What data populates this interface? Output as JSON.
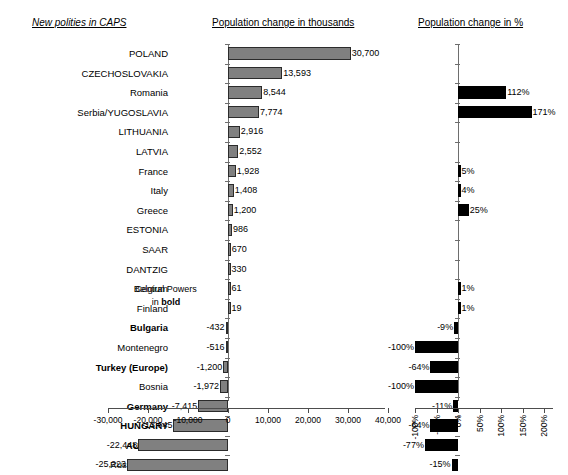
{
  "headers": {
    "legend_note": "New polities in CAPS",
    "left_title": "Population change in thousands",
    "right_title": "Population change in %"
  },
  "annotation": {
    "line1": "Central Powers",
    "line2_prefix": "in ",
    "line2_bold": "bold"
  },
  "chart_data": {
    "type": "bar",
    "orientation": "horizontal",
    "grid": false,
    "legend": false,
    "categories": [
      "POLAND",
      "CZECHOSLOVAKIA",
      "Romania",
      "Serbia/YUGOSLAVIA",
      "LITHUANIA",
      "LATVIA",
      "France",
      "Italy",
      "Greece",
      "ESTONIA",
      "SAAR",
      "DANTZIG",
      "Belgium",
      "Finland",
      "Bulgaria",
      "Montenegro",
      "Turkey (Europe)",
      "Bosnia",
      "Germany",
      "HUNGARY",
      "AUSTRIA",
      "Russia/USSR"
    ],
    "category_styles": [
      "normal",
      "normal",
      "normal",
      "normal",
      "normal",
      "normal",
      "normal",
      "normal",
      "normal",
      "normal",
      "normal",
      "normal",
      "normal",
      "normal",
      "bold",
      "normal",
      "bold",
      "normal",
      "bold",
      "bold",
      "bold",
      "normal"
    ],
    "panels": [
      {
        "name": "thousands",
        "xlabel": "Population change in thousands",
        "xlim": [
          -30000,
          40000
        ],
        "xticks": [
          -30000,
          -20000,
          -10000,
          0,
          10000,
          20000,
          30000,
          40000
        ],
        "xticklabels": [
          "-30,000",
          "-20,000",
          "-10,000",
          "0",
          "10,000",
          "20,000",
          "30,000",
          "40,000"
        ],
        "values": [
          30700,
          13593,
          8544,
          7774,
          2916,
          2552,
          1928,
          1408,
          1200,
          986,
          670,
          330,
          61,
          19,
          -432,
          -516,
          -1200,
          -1972,
          -7415,
          -13645,
          -22448,
          -25223
        ],
        "datalabels": [
          "30,700",
          "13,593",
          "8,544",
          "7,774",
          "2,916",
          "2,552",
          "1,928",
          "1,408",
          "1,200",
          "986",
          "670",
          "330",
          "61",
          "19",
          "-432",
          "-516",
          "-1,200",
          "-1,972",
          "-7,415",
          "-13,645",
          "-22,448",
          "-25,223"
        ],
        "bar_color": "#808080",
        "bar_border": "#2b2b2b"
      },
      {
        "name": "percent",
        "xlabel": "Population change in %",
        "xlim": [
          -100,
          200
        ],
        "xticks": [
          -100,
          -50,
          0,
          50,
          100,
          150,
          200
        ],
        "xticklabels": [
          "-100%",
          "-50%",
          "0%",
          "50%",
          "100%",
          "150%",
          "200%"
        ],
        "values": [
          null,
          null,
          112,
          171,
          null,
          null,
          5,
          4,
          25,
          null,
          null,
          null,
          1,
          1,
          -9,
          -100,
          -64,
          -100,
          -11,
          -64,
          -77,
          -15
        ],
        "datalabels": [
          "",
          "",
          "112%",
          "171%",
          "",
          "",
          "5%",
          "4%",
          "25%",
          "",
          "",
          "",
          "1%",
          "1%",
          "-9%",
          "-100%",
          "-64%",
          "-100%",
          "-11%",
          "-64%",
          "-77%",
          "-15%"
        ],
        "bar_color": "#000000"
      }
    ]
  }
}
